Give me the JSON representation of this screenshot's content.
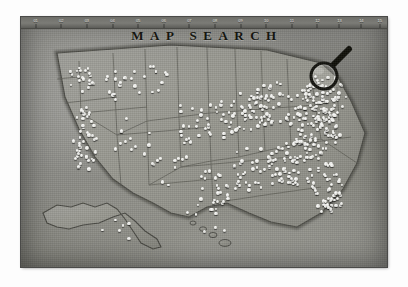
{
  "page": {
    "title": "MAP SEARCH",
    "medium": "monochrome photograph of a wall map of the United States studded with white push-pins",
    "background_color": "#ffffff",
    "plate_color": "#8e8e8a",
    "ink_color": "#15150f",
    "pin_color": "#ffffff"
  },
  "ruler": {
    "name": "top-edge-ruler",
    "ticks": [
      {
        "label": "01",
        "x": 4
      },
      {
        "label": "02",
        "x": 11
      },
      {
        "label": "03",
        "x": 18
      },
      {
        "label": "04",
        "x": 25
      },
      {
        "label": "05",
        "x": 32
      },
      {
        "label": "06",
        "x": 39
      },
      {
        "label": "07",
        "x": 46
      },
      {
        "label": "08",
        "x": 53
      },
      {
        "label": "09",
        "x": 60
      },
      {
        "label": "10",
        "x": 67
      },
      {
        "label": "11",
        "x": 74
      },
      {
        "label": "12",
        "x": 81
      },
      {
        "label": "13",
        "x": 87
      },
      {
        "label": "14",
        "x": 93
      },
      {
        "label": "15",
        "x": 98
      }
    ]
  },
  "magnifier": {
    "name": "magnifying-glass",
    "label": "Magnifying glass",
    "lens_center_x": 35,
    "lens_center_y": 45,
    "lens_radius": 13,
    "handle_angle_deg": -45,
    "color": "#14140f"
  },
  "map": {
    "name": "united-states-map",
    "regions": [
      "Contiguous United States",
      "Alaska",
      "Hawaii"
    ],
    "border_style": "state-outlines",
    "pin_count": 620,
    "pin_density_note": "dense along the Atlantic seaboard, Great Lakes, Gulf Coast, Florida and the California coast; sparse through the Mountain West and Great Plains"
  },
  "frame": {
    "name": "photo-frame",
    "left": 21,
    "top": 17,
    "width": 366,
    "height": 250
  }
}
